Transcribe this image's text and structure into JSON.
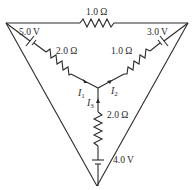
{
  "diagram": {
    "type": "circuit",
    "components": {
      "top_resistor": {
        "label": "1.0 Ω"
      },
      "left_battery": {
        "label": "5.0 V"
      },
      "right_battery": {
        "label": "3.0 V"
      },
      "left_resistor": {
        "label": "2.0 Ω"
      },
      "right_resistor": {
        "label": "1.0 Ω"
      },
      "bottom_resistor": {
        "label": "2.0 Ω"
      },
      "bottom_battery": {
        "label": "4.0 V"
      }
    },
    "currents": [
      {
        "name": "I",
        "sub": "1",
        "direction": "toward junction"
      },
      {
        "name": "I",
        "sub": "2",
        "direction": "away from junction"
      },
      {
        "name": "I",
        "sub": "3",
        "direction": "toward junction"
      }
    ]
  }
}
